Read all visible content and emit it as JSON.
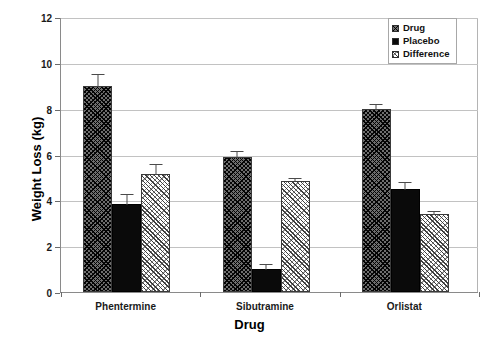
{
  "chart_data": {
    "type": "bar",
    "title": "",
    "xlabel": "Drug",
    "ylabel": "Weight Loss (kg)",
    "categories": [
      "Phentermine",
      "Sibutramine",
      "Orlistat"
    ],
    "ylim": [
      0,
      12
    ],
    "yticks": [
      0,
      2,
      4,
      6,
      8,
      10,
      12
    ],
    "ytick_labels": [
      "0",
      "2",
      "4",
      "6",
      "8",
      "10",
      "12"
    ],
    "grid": true,
    "legend_position": "top-right",
    "series": [
      {
        "name": "Drug",
        "pattern": "dark-crosshatch",
        "values": [
          9.0,
          5.9,
          8.0
        ],
        "errors": [
          0.55,
          0.3,
          0.25
        ]
      },
      {
        "name": "Placebo",
        "pattern": "solid-black",
        "values": [
          3.85,
          1.0,
          4.5
        ],
        "errors": [
          0.45,
          0.25,
          0.35
        ]
      },
      {
        "name": "Difference",
        "pattern": "light-hatch",
        "values": [
          5.15,
          4.85,
          3.4
        ],
        "errors": [
          0.5,
          0.15,
          0.2
        ]
      }
    ]
  },
  "legend": {
    "items": [
      {
        "label": "Drug",
        "swatch": "dark-crosshatch"
      },
      {
        "label": "Placebo",
        "swatch": "solid-black"
      },
      {
        "label": "Difference",
        "swatch": "light-hatch"
      }
    ]
  },
  "axes": {
    "y_title": "Weight Loss (kg)",
    "x_title": "Drug"
  }
}
